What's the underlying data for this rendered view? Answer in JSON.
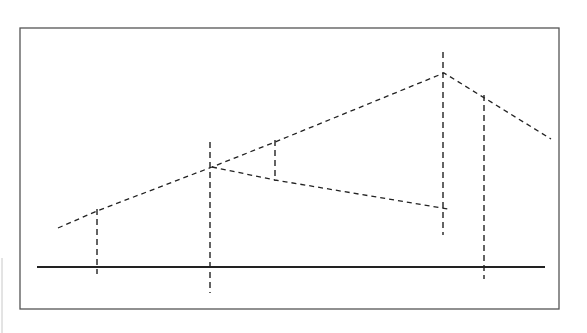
{
  "diagram": {
    "title": "",
    "colors": {
      "line": "#222222",
      "frame": "#555555",
      "background": "#ffffff"
    },
    "frame": {
      "x": 20,
      "y": 28,
      "width": 539,
      "height": 281
    },
    "ground_line": {
      "x1": 37,
      "y1": 267,
      "x2": 545,
      "y2": 267
    },
    "upper_dashed_line": {
      "points": [
        [
          58,
          228
        ],
        [
          97,
          211
        ],
        [
          212,
          167
        ],
        [
          275,
          142
        ],
        [
          444,
          73
        ],
        [
          551,
          139
        ]
      ]
    },
    "lower_dashed_line": {
      "points": [
        [
          212,
          167
        ],
        [
          275,
          180
        ],
        [
          448,
          209
        ]
      ]
    },
    "vertical_dashed_lines": [
      {
        "x": 97,
        "y1": 209,
        "y2": 274
      },
      {
        "x": 210,
        "y1": 142,
        "y2": 293
      },
      {
        "x": 275,
        "y1": 140,
        "y2": 181
      },
      {
        "x": 443,
        "y1": 52,
        "y2": 235
      },
      {
        "x": 484,
        "y1": 95,
        "y2": 279
      }
    ]
  }
}
